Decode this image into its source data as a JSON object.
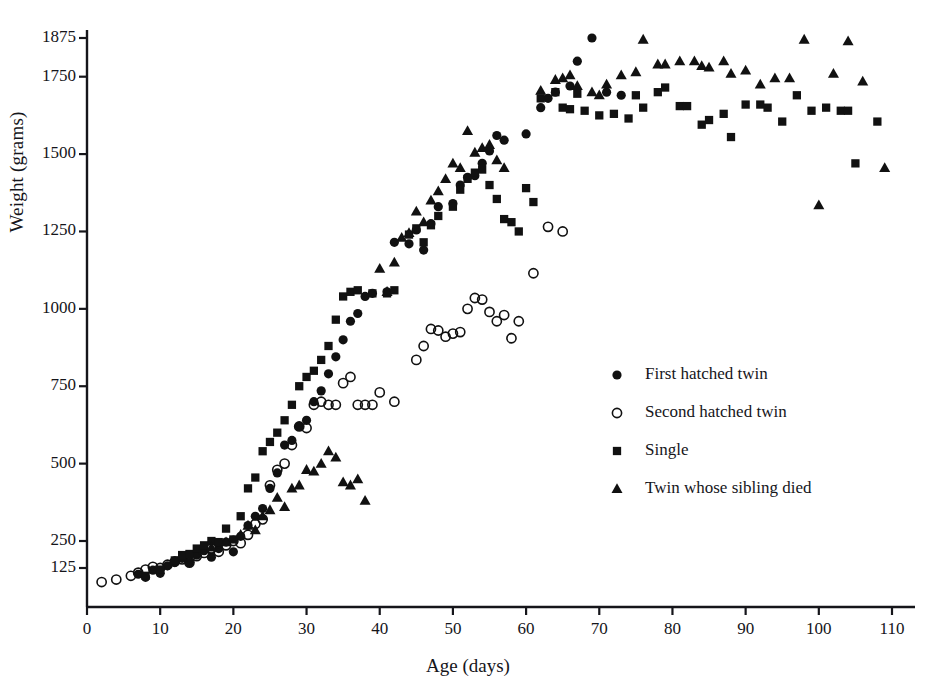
{
  "chart_data": {
    "type": "scatter",
    "title": "",
    "xlabel": "Age (days)",
    "ylabel": "Weight (grams)",
    "xlim": [
      0,
      113
    ],
    "ylim": [
      60,
      1940
    ],
    "grid": false,
    "legend_position": "center-right",
    "xticks": [
      0,
      10,
      20,
      30,
      40,
      50,
      60,
      70,
      80,
      90,
      100,
      110
    ],
    "xtick_labels": [
      "0",
      "10",
      "20",
      "30",
      "40",
      "50",
      "60",
      "70",
      "80",
      "90",
      "100",
      "110"
    ],
    "yticks": [
      125,
      250,
      500,
      750,
      1000,
      1250,
      1500,
      1750,
      1875
    ],
    "ytick_labels": [
      "125",
      "250",
      "500",
      "750",
      "1000",
      "1250",
      "1500",
      "1750",
      "1875"
    ],
    "series": [
      {
        "name": "First hatched twin",
        "marker": "filled-circle",
        "color": "#111111",
        "points": [
          [
            7,
            105
          ],
          [
            8,
            95
          ],
          [
            9,
            118
          ],
          [
            10,
            108
          ],
          [
            11,
            135
          ],
          [
            12,
            150
          ],
          [
            13,
            170
          ],
          [
            14,
            150
          ],
          [
            15,
            185
          ],
          [
            16,
            205
          ],
          [
            17,
            175
          ],
          [
            18,
            215
          ],
          [
            19,
            245
          ],
          [
            20,
            200
          ],
          [
            21,
            265
          ],
          [
            22,
            300
          ],
          [
            23,
            330
          ],
          [
            24,
            355
          ],
          [
            25,
            420
          ],
          [
            26,
            470
          ],
          [
            27,
            560
          ],
          [
            28,
            575
          ],
          [
            29,
            620
          ],
          [
            30,
            640
          ],
          [
            31,
            700
          ],
          [
            32,
            735
          ],
          [
            33,
            790
          ],
          [
            34,
            845
          ],
          [
            35,
            900
          ],
          [
            36,
            960
          ],
          [
            37,
            985
          ],
          [
            38,
            1040
          ],
          [
            39,
            1050
          ],
          [
            41,
            1055
          ],
          [
            42,
            1215
          ],
          [
            44,
            1210
          ],
          [
            45,
            1255
          ],
          [
            46,
            1190
          ],
          [
            47,
            1275
          ],
          [
            48,
            1330
          ],
          [
            50,
            1340
          ],
          [
            51,
            1400
          ],
          [
            52,
            1425
          ],
          [
            53,
            1430
          ],
          [
            54,
            1470
          ],
          [
            55,
            1510
          ],
          [
            56,
            1560
          ],
          [
            57,
            1545
          ],
          [
            60,
            1565
          ],
          [
            62,
            1650
          ],
          [
            63,
            1680
          ],
          [
            64,
            1700
          ],
          [
            66,
            1720
          ],
          [
            67,
            1800
          ],
          [
            69,
            1875
          ],
          [
            71,
            1700
          ],
          [
            73,
            1690
          ]
        ]
      },
      {
        "name": "Second hatched twin",
        "marker": "open-circle",
        "color": "#111111",
        "points": [
          [
            2,
            80
          ],
          [
            4,
            88
          ],
          [
            6,
            100
          ],
          [
            7,
            110
          ],
          [
            8,
            120
          ],
          [
            9,
            130
          ],
          [
            10,
            125
          ],
          [
            11,
            140
          ],
          [
            12,
            155
          ],
          [
            13,
            165
          ],
          [
            14,
            150
          ],
          [
            15,
            180
          ],
          [
            16,
            195
          ],
          [
            17,
            215
          ],
          [
            18,
            200
          ],
          [
            19,
            230
          ],
          [
            20,
            250
          ],
          [
            21,
            240
          ],
          [
            22,
            270
          ],
          [
            23,
            305
          ],
          [
            24,
            320
          ],
          [
            25,
            430
          ],
          [
            26,
            480
          ],
          [
            27,
            500
          ],
          [
            28,
            560
          ],
          [
            29,
            620
          ],
          [
            30,
            615
          ],
          [
            31,
            690
          ],
          [
            32,
            700
          ],
          [
            33,
            690
          ],
          [
            34,
            690
          ],
          [
            35,
            760
          ],
          [
            36,
            780
          ],
          [
            37,
            690
          ],
          [
            38,
            690
          ],
          [
            39,
            690
          ],
          [
            40,
            730
          ],
          [
            42,
            700
          ],
          [
            45,
            835
          ],
          [
            46,
            880
          ],
          [
            47,
            935
          ],
          [
            48,
            930
          ],
          [
            49,
            910
          ],
          [
            50,
            920
          ],
          [
            51,
            925
          ],
          [
            52,
            1000
          ],
          [
            53,
            1035
          ],
          [
            54,
            1030
          ],
          [
            55,
            990
          ],
          [
            56,
            960
          ],
          [
            57,
            980
          ],
          [
            58,
            905
          ],
          [
            59,
            960
          ],
          [
            61,
            1115
          ],
          [
            63,
            1265
          ],
          [
            65,
            1250
          ]
        ]
      },
      {
        "name": "Single",
        "marker": "filled-square",
        "color": "#111111",
        "points": [
          [
            8,
            100
          ],
          [
            10,
            120
          ],
          [
            12,
            160
          ],
          [
            13,
            185
          ],
          [
            14,
            190
          ],
          [
            15,
            215
          ],
          [
            16,
            230
          ],
          [
            17,
            250
          ],
          [
            18,
            245
          ],
          [
            19,
            290
          ],
          [
            20,
            255
          ],
          [
            21,
            330
          ],
          [
            22,
            420
          ],
          [
            23,
            455
          ],
          [
            24,
            540
          ],
          [
            25,
            570
          ],
          [
            26,
            600
          ],
          [
            27,
            640
          ],
          [
            28,
            690
          ],
          [
            29,
            750
          ],
          [
            30,
            780
          ],
          [
            31,
            800
          ],
          [
            32,
            835
          ],
          [
            33,
            880
          ],
          [
            34,
            965
          ],
          [
            35,
            1040
          ],
          [
            36,
            1055
          ],
          [
            37,
            1060
          ],
          [
            39,
            1050
          ],
          [
            41,
            1050
          ],
          [
            42,
            1060
          ],
          [
            44,
            1240
          ],
          [
            45,
            1260
          ],
          [
            46,
            1215
          ],
          [
            47,
            1270
          ],
          [
            48,
            1300
          ],
          [
            50,
            1330
          ],
          [
            51,
            1385
          ],
          [
            52,
            1420
          ],
          [
            53,
            1440
          ],
          [
            54,
            1450
          ],
          [
            55,
            1400
          ],
          [
            56,
            1355
          ],
          [
            57,
            1290
          ],
          [
            58,
            1280
          ],
          [
            59,
            1250
          ],
          [
            60,
            1390
          ],
          [
            61,
            1345
          ],
          [
            62,
            1680
          ],
          [
            64,
            1700
          ],
          [
            65,
            1650
          ],
          [
            66,
            1645
          ],
          [
            67,
            1695
          ],
          [
            68,
            1640
          ],
          [
            70,
            1625
          ],
          [
            72,
            1630
          ],
          [
            74,
            1615
          ],
          [
            75,
            1690
          ],
          [
            76,
            1650
          ],
          [
            78,
            1700
          ],
          [
            79,
            1715
          ],
          [
            81,
            1655
          ],
          [
            82,
            1655
          ],
          [
            84,
            1595
          ],
          [
            85,
            1610
          ],
          [
            87,
            1630
          ],
          [
            88,
            1555
          ],
          [
            90,
            1660
          ],
          [
            92,
            1660
          ],
          [
            93,
            1650
          ],
          [
            95,
            1605
          ],
          [
            97,
            1690
          ],
          [
            99,
            1640
          ],
          [
            101,
            1650
          ],
          [
            103,
            1640
          ],
          [
            104,
            1640
          ],
          [
            105,
            1470
          ],
          [
            108,
            1605
          ]
        ]
      },
      {
        "name": "Twin whose sibling died",
        "marker": "filled-triangle",
        "color": "#111111",
        "points": [
          [
            17,
            220
          ],
          [
            19,
            245
          ],
          [
            21,
            270
          ],
          [
            22,
            300
          ],
          [
            23,
            285
          ],
          [
            24,
            330
          ],
          [
            25,
            350
          ],
          [
            26,
            390
          ],
          [
            27,
            360
          ],
          [
            28,
            420
          ],
          [
            29,
            430
          ],
          [
            30,
            480
          ],
          [
            31,
            475
          ],
          [
            32,
            500
          ],
          [
            33,
            540
          ],
          [
            34,
            520
          ],
          [
            35,
            440
          ],
          [
            36,
            430
          ],
          [
            37,
            450
          ],
          [
            38,
            380
          ],
          [
            40,
            1130
          ],
          [
            41,
            1055
          ],
          [
            42,
            1150
          ],
          [
            43,
            1230
          ],
          [
            44,
            1245
          ],
          [
            45,
            1315
          ],
          [
            46,
            1280
          ],
          [
            47,
            1350
          ],
          [
            48,
            1380
          ],
          [
            49,
            1420
          ],
          [
            50,
            1470
          ],
          [
            51,
            1455
          ],
          [
            52,
            1575
          ],
          [
            53,
            1505
          ],
          [
            54,
            1520
          ],
          [
            55,
            1530
          ],
          [
            56,
            1480
          ],
          [
            57,
            1455
          ],
          [
            62,
            1705
          ],
          [
            64,
            1740
          ],
          [
            65,
            1745
          ],
          [
            66,
            1755
          ],
          [
            67,
            1720
          ],
          [
            69,
            1700
          ],
          [
            70,
            1690
          ],
          [
            71,
            1725
          ],
          [
            73,
            1755
          ],
          [
            75,
            1765
          ],
          [
            76,
            1870
          ],
          [
            78,
            1790
          ],
          [
            79,
            1790
          ],
          [
            81,
            1800
          ],
          [
            83,
            1800
          ],
          [
            84,
            1785
          ],
          [
            85,
            1780
          ],
          [
            87,
            1800
          ],
          [
            88,
            1760
          ],
          [
            90,
            1770
          ],
          [
            92,
            1725
          ],
          [
            94,
            1745
          ],
          [
            96,
            1745
          ],
          [
            98,
            1870
          ],
          [
            100,
            1335
          ],
          [
            102,
            1760
          ],
          [
            104,
            1865
          ],
          [
            106,
            1735
          ],
          [
            109,
            1455
          ]
        ]
      }
    ]
  },
  "legend": {
    "entries": [
      {
        "label": "First hatched twin",
        "marker": "filled-circle"
      },
      {
        "label": "Second hatched twin",
        "marker": "open-circle"
      },
      {
        "label": "Single",
        "marker": "filled-square"
      },
      {
        "label": "Twin whose sibling died",
        "marker": "filled-triangle"
      }
    ]
  }
}
